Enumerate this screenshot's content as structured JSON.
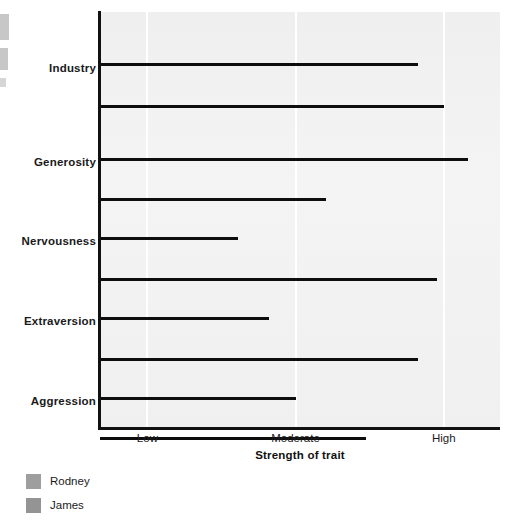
{
  "chart_data": {
    "type": "bar",
    "orientation": "horizontal",
    "title": "",
    "xlabel": "Strength of trait",
    "ylabel": "",
    "categories": [
      "Industry",
      "Generosity",
      "Nervousness",
      "Extraversion",
      "Aggression"
    ],
    "xticks": [
      {
        "label": "Low",
        "value": 1
      },
      {
        "label": "Moderate",
        "value": 2
      },
      {
        "label": "High",
        "value": 3
      }
    ],
    "xlim": [
      0.68,
      3.38
    ],
    "grid": "vertical-white-gridlines-at-ticks",
    "legend_position": "below-axis-left",
    "series": [
      {
        "name": "Rodney",
        "color": "#9e9e9e",
        "values": [
          2.81,
          3.15,
          1.6,
          1.81,
          1.99
        ]
      },
      {
        "name": "James",
        "color": "#949494",
        "values": [
          2.99,
          2.19,
          2.94,
          2.81,
          2.46
        ]
      }
    ]
  },
  "legend": {
    "items": [
      {
        "label": "Rodney",
        "color": "#9e9e9e"
      },
      {
        "label": "James",
        "color": "#949494"
      }
    ]
  },
  "axis": {
    "x_title": "Strength of trait",
    "tick_labels": [
      "Low",
      "Moderate",
      "High"
    ],
    "category_labels": [
      "Industry",
      "Generosity",
      "Nervousness",
      "Extraversion",
      "Aggression"
    ]
  },
  "colors": {
    "plot_background": "#f2f2f2",
    "axis_line": "#111111",
    "gridline": "#ffffff",
    "bar_baseline": "#0d0d0d",
    "text": "#1c1c1c"
  }
}
